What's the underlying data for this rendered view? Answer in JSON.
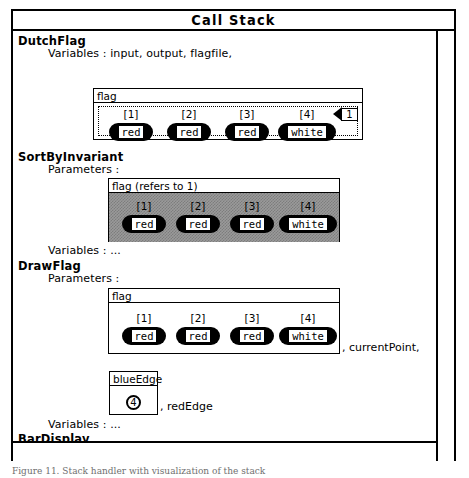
{
  "window": {
    "title": "Call Stack",
    "scrollbars": {
      "vertical": "vertical-scrollbar",
      "horizontal": "horizontal-scrollbar"
    }
  },
  "frames": [
    {
      "name": "DutchFlag",
      "lines": [
        "Variables : input, output, flagfile,"
      ],
      "box": {
        "header": "flag",
        "shaded": false,
        "dotted": true,
        "cells": [
          {
            "index": "[1]",
            "value": "red"
          },
          {
            "index": "[2]",
            "value": "red"
          },
          {
            "index": "[3]",
            "value": "red"
          },
          {
            "index": "[4]",
            "value": "white"
          }
        ],
        "pointer": {
          "label": "1"
        }
      }
    },
    {
      "name": "SortByInvariant",
      "lines": [
        "Parameters :"
      ],
      "box": {
        "header": "flag  (refers to 1)",
        "shaded": true,
        "dotted": false,
        "cells": [
          {
            "index": "[1]",
            "value": "red"
          },
          {
            "index": "[2]",
            "value": "red"
          },
          {
            "index": "[3]",
            "value": "red"
          },
          {
            "index": "[4]",
            "value": "white"
          }
        ]
      },
      "footer": "Variables : ..."
    },
    {
      "name": "DrawFlag",
      "lines": [
        "Parameters :"
      ],
      "box": {
        "header": "flag",
        "shaded": false,
        "dotted": false,
        "cells": [
          {
            "index": "[1]",
            "value": "red"
          },
          {
            "index": "[2]",
            "value": "red"
          },
          {
            "index": "[3]",
            "value": "red"
          },
          {
            "index": "[4]",
            "value": "white"
          }
        ]
      },
      "trailing": ", currentPoint,",
      "scalar": {
        "header": "blueEdge",
        "value": "4",
        "trailing": ", redEdge"
      },
      "footer": "Variables : ..."
    },
    {
      "name": "BarDisplay",
      "lines": [
        "Parameters : whichbar, value"
      ]
    }
  ],
  "caption": "Figure 11. Stack handler with visualization of the stack"
}
